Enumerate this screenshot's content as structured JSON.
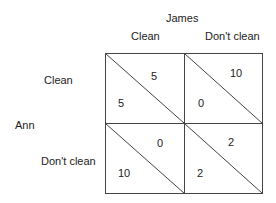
{
  "player_column": "James",
  "player_row": "Ann",
  "column_strategies": [
    "Clean",
    "Don't clean"
  ],
  "row_strategies": [
    "Clean",
    "Don't clean"
  ],
  "cells": [
    {
      "row": "Clean",
      "col": "Clean",
      "ann": "5",
      "james": "5"
    },
    {
      "row": "Clean",
      "col": "Don't clean",
      "ann": "0",
      "james": "10"
    },
    {
      "row": "Don't clean",
      "col": "Clean",
      "ann": "10",
      "james": "0"
    },
    {
      "row": "Don't clean",
      "col": "Don't clean",
      "ann": "2",
      "james": "2"
    }
  ],
  "colors": {
    "line": "#444444",
    "text": "#222222"
  }
}
